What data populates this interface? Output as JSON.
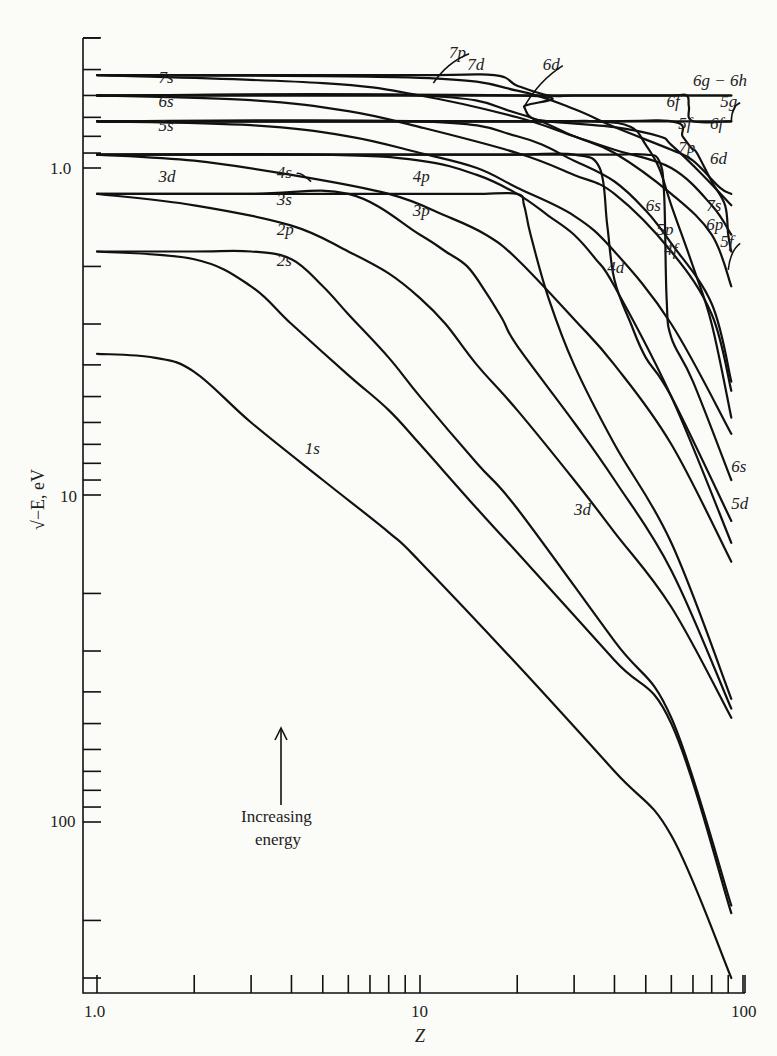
{
  "chart_data": {
    "type": "line",
    "title": "",
    "xlabel": "Z",
    "ylabel": "√−E, eV",
    "xscale": "log",
    "yscale": "log",
    "y_inverted": true,
    "xlim": [
      1.0,
      100
    ],
    "ylim": [
      0.4,
      340
    ],
    "grid": false,
    "x_ticks": [
      1,
      2,
      3,
      4,
      5,
      6,
      7,
      8,
      9,
      10,
      20,
      30,
      40,
      50,
      60,
      70,
      80,
      90,
      100
    ],
    "x_tick_labels": [
      {
        "value": 1.0,
        "label": "1.0"
      },
      {
        "value": 10,
        "label": "10"
      },
      {
        "value": 100,
        "label": "100"
      }
    ],
    "y_ticks": [
      0.4,
      0.5,
      0.6,
      0.7,
      0.8,
      0.9,
      1,
      2,
      3,
      4,
      5,
      6,
      7,
      8,
      9,
      10,
      20,
      30,
      40,
      50,
      60,
      70,
      80,
      90,
      100,
      200,
      300
    ],
    "y_tick_labels": [
      {
        "value": 1.0,
        "label": "1.0"
      },
      {
        "value": 10,
        "label": "10"
      },
      {
        "value": 100,
        "label": "100"
      }
    ],
    "annotation": {
      "text_line1": "Increasing",
      "text_line2": "energy",
      "arrow": "up"
    },
    "series": [
      {
        "name": "1s",
        "x": [
          1,
          1.5,
          2,
          3,
          5,
          8,
          10,
          20,
          40,
          60,
          92
        ],
        "y": [
          3.7,
          3.8,
          4.2,
          6,
          9,
          13,
          16,
          33,
          70,
          110,
          300
        ]
      },
      {
        "name": "2s",
        "x": [
          1,
          2,
          3,
          4,
          6,
          8,
          10,
          15,
          20,
          40,
          60,
          92
        ],
        "y": [
          1.8,
          1.9,
          2.3,
          3,
          4.3,
          5.5,
          7,
          11,
          15,
          32,
          50,
          190
        ]
      },
      {
        "name": "2p",
        "x": [
          1,
          2,
          3,
          4,
          5,
          6,
          8,
          10,
          15,
          20,
          40,
          60,
          92
        ],
        "y": [
          1.8,
          1.8,
          1.8,
          1.9,
          2.3,
          2.8,
          3.8,
          5,
          8,
          11,
          28,
          48,
          180
        ]
      },
      {
        "name": "3s",
        "x": [
          1,
          2,
          4,
          6,
          8,
          10,
          12,
          15,
          20,
          30,
          40,
          60,
          92
        ],
        "y": [
          1.2,
          1.3,
          1.5,
          1.8,
          2.1,
          2.5,
          3,
          4,
          5.5,
          9,
          13,
          22,
          48
        ]
      },
      {
        "name": "3p",
        "x": [
          1,
          3,
          6,
          10,
          12,
          14,
          16,
          18,
          20,
          30,
          40,
          60,
          92
        ],
        "y": [
          1.2,
          1.2,
          1.2,
          1.6,
          1.8,
          2,
          2.4,
          2.9,
          3.5,
          6,
          9,
          17,
          45
        ]
      },
      {
        "name": "3d",
        "x": [
          1,
          5,
          10,
          15,
          20,
          21,
          22,
          25,
          30,
          40,
          60,
          92
        ],
        "y": [
          1.2,
          1.2,
          1.2,
          1.2,
          1.2,
          1.3,
          1.6,
          2.5,
          4,
          7,
          14,
          42
        ]
      },
      {
        "name": "4s",
        "x": [
          1,
          2,
          4,
          8,
          12,
          16,
          20,
          30,
          40,
          60,
          92
        ],
        "y": [
          0.91,
          0.95,
          1.05,
          1.2,
          1.4,
          1.6,
          1.9,
          2.9,
          4,
          7,
          16
        ]
      },
      {
        "name": "4p",
        "x": [
          1,
          5,
          10,
          15,
          20,
          25,
          30,
          35,
          40,
          60,
          92
        ],
        "y": [
          0.91,
          0.91,
          0.95,
          1.05,
          1.2,
          1.4,
          1.6,
          1.9,
          2.3,
          5,
          14
        ]
      },
      {
        "name": "4d",
        "x": [
          1,
          10,
          20,
          30,
          36,
          38,
          40,
          45,
          50,
          60,
          92
        ],
        "y": [
          0.91,
          0.91,
          0.91,
          0.91,
          1.0,
          1.5,
          2.2,
          3,
          3.8,
          5,
          12
        ]
      },
      {
        "name": "4f",
        "x": [
          1,
          20,
          30,
          40,
          50,
          55,
          57,
          58,
          60,
          70,
          92
        ],
        "y": [
          0.91,
          0.91,
          0.91,
          0.91,
          0.91,
          0.95,
          1.2,
          2.5,
          3.3,
          4.5,
          9
        ]
      },
      {
        "name": "5s",
        "x": [
          1,
          3,
          6,
          10,
          15,
          20,
          30,
          40,
          60,
          92
        ],
        "y": [
          0.72,
          0.74,
          0.8,
          0.9,
          1.0,
          1.15,
          1.4,
          1.8,
          3,
          6.5
        ]
      },
      {
        "name": "5p",
        "x": [
          1,
          10,
          20,
          30,
          40,
          50,
          60,
          80,
          92
        ],
        "y": [
          0.72,
          0.72,
          0.8,
          0.95,
          1.1,
          1.35,
          1.7,
          2.6,
          4.5
        ]
      },
      {
        "name": "5d",
        "x": [
          1,
          20,
          35,
          45,
          50,
          55,
          60,
          70,
          80,
          92
        ],
        "y": [
          0.72,
          0.72,
          0.72,
          0.75,
          0.85,
          1.0,
          1.3,
          2,
          3,
          5.8
        ]
      },
      {
        "name": "5f",
        "x": [
          1,
          30,
          60,
          65,
          68,
          70,
          72,
          80,
          88,
          90,
          92
        ],
        "y": [
          0.72,
          0.72,
          0.72,
          0.8,
          0.85,
          0.88,
          0.9,
          1.1,
          1.3,
          1.6,
          1.8
        ]
      },
      {
        "name": "5g",
        "x": [
          1,
          30,
          60,
          92
        ],
        "y": [
          0.72,
          0.72,
          0.72,
          0.72
        ]
      },
      {
        "name": "6s",
        "x": [
          1,
          3,
          6,
          10,
          20,
          30,
          40,
          60,
          80,
          92
        ],
        "y": [
          0.6,
          0.62,
          0.67,
          0.75,
          0.9,
          1.05,
          1.2,
          1.8,
          2.8,
          4.8
        ]
      },
      {
        "name": "6p",
        "x": [
          1,
          10,
          20,
          30,
          40,
          60,
          80,
          92
        ],
        "y": [
          0.6,
          0.6,
          0.68,
          0.8,
          0.9,
          1.2,
          1.6,
          2.3
        ]
      },
      {
        "name": "6d",
        "x": [
          1,
          20,
          21,
          22,
          25,
          40,
          55,
          60,
          75,
          92
        ],
        "y": [
          0.6,
          0.6,
          0.65,
          0.7,
          0.72,
          0.75,
          0.8,
          0.85,
          1.05,
          1.3
        ]
      },
      {
        "name": "6f",
        "x": [
          1,
          40,
          60,
          67,
          68,
          70,
          92
        ],
        "y": [
          0.6,
          0.6,
          0.6,
          0.6,
          0.65,
          0.72,
          0.72
        ]
      },
      {
        "name": "6g-6h",
        "x": [
          1,
          30,
          60,
          92
        ],
        "y": [
          0.6,
          0.6,
          0.6,
          0.6
        ]
      },
      {
        "name": "7s",
        "x": [
          1,
          5,
          10,
          20,
          30,
          40,
          60,
          80,
          92
        ],
        "y": [
          0.52,
          0.55,
          0.6,
          0.7,
          0.8,
          0.88,
          1.0,
          1.3,
          1.6
        ]
      },
      {
        "name": "7p",
        "x": [
          1,
          10,
          20,
          30,
          40,
          60,
          70,
          85,
          92
        ],
        "y": [
          0.52,
          0.53,
          0.58,
          0.66,
          0.75,
          0.88,
          0.95,
          1.15,
          1.2
        ]
      },
      {
        "name": "7d",
        "x": [
          1,
          10,
          17,
          20,
          25,
          30,
          40,
          60,
          92
        ],
        "y": [
          0.52,
          0.52,
          0.52,
          0.56,
          0.6,
          0.6,
          0.6,
          0.6,
          0.6
        ]
      }
    ],
    "labels": [
      {
        "text": "7p",
        "z": 12.3,
        "v": 0.46,
        "arrow_to": [
          11,
          0.55
        ]
      },
      {
        "text": "7d",
        "z": 14,
        "v": 0.5
      },
      {
        "text": "6d",
        "z": 24,
        "v": 0.5,
        "arrow_to": [
          21,
          0.65
        ]
      },
      {
        "text": "6g − 6h",
        "z": 70,
        "v": 0.56
      },
      {
        "text": "6f",
        "z": 58,
        "v": 0.65
      },
      {
        "text": "5g",
        "z": 85,
        "v": 0.65,
        "arrow_to": [
          92,
          0.72
        ]
      },
      {
        "text": "5f",
        "z": 63,
        "v": 0.76
      },
      {
        "text": "6f",
        "z": 79,
        "v": 0.76
      },
      {
        "text": "7p",
        "z": 63,
        "v": 0.9
      },
      {
        "text": "6d",
        "z": 79,
        "v": 0.97
      },
      {
        "text": "7s",
        "z": 77,
        "v": 1.35
      },
      {
        "text": "6p",
        "z": 77,
        "v": 1.55
      },
      {
        "text": "5f",
        "z": 85,
        "v": 1.75,
        "arrow_to": [
          90,
          2.05
        ]
      },
      {
        "text": "6s",
        "z": 50,
        "v": 1.35
      },
      {
        "text": "5p",
        "z": 54,
        "v": 1.6
      },
      {
        "text": "4f",
        "z": 57,
        "v": 1.85
      },
      {
        "text": "4d",
        "z": 38,
        "v": 2.1
      },
      {
        "text": "7s",
        "z": 1.55,
        "v": 0.55
      },
      {
        "text": "6s",
        "z": 1.55,
        "v": 0.65
      },
      {
        "text": "5s",
        "z": 1.55,
        "v": 0.77
      },
      {
        "text": "4s",
        "z": 3.6,
        "v": 1.07,
        "arrow_to": [
          4.6,
          1.1
        ]
      },
      {
        "text": "3d",
        "z": 1.55,
        "v": 1.1
      },
      {
        "text": "4p",
        "z": 9.5,
        "v": 1.1
      },
      {
        "text": "3s",
        "z": 3.6,
        "v": 1.3
      },
      {
        "text": "3p",
        "z": 9.5,
        "v": 1.4
      },
      {
        "text": "2p",
        "z": 3.6,
        "v": 1.6
      },
      {
        "text": "2s",
        "z": 3.6,
        "v": 2.0
      },
      {
        "text": "1s",
        "z": 4.4,
        "v": 7.5
      },
      {
        "text": "3d",
        "z": 30,
        "v": 11.5
      },
      {
        "text": "6s",
        "z": 92,
        "v": 8.5
      },
      {
        "text": "5d",
        "z": 92,
        "v": 11
      }
    ]
  }
}
